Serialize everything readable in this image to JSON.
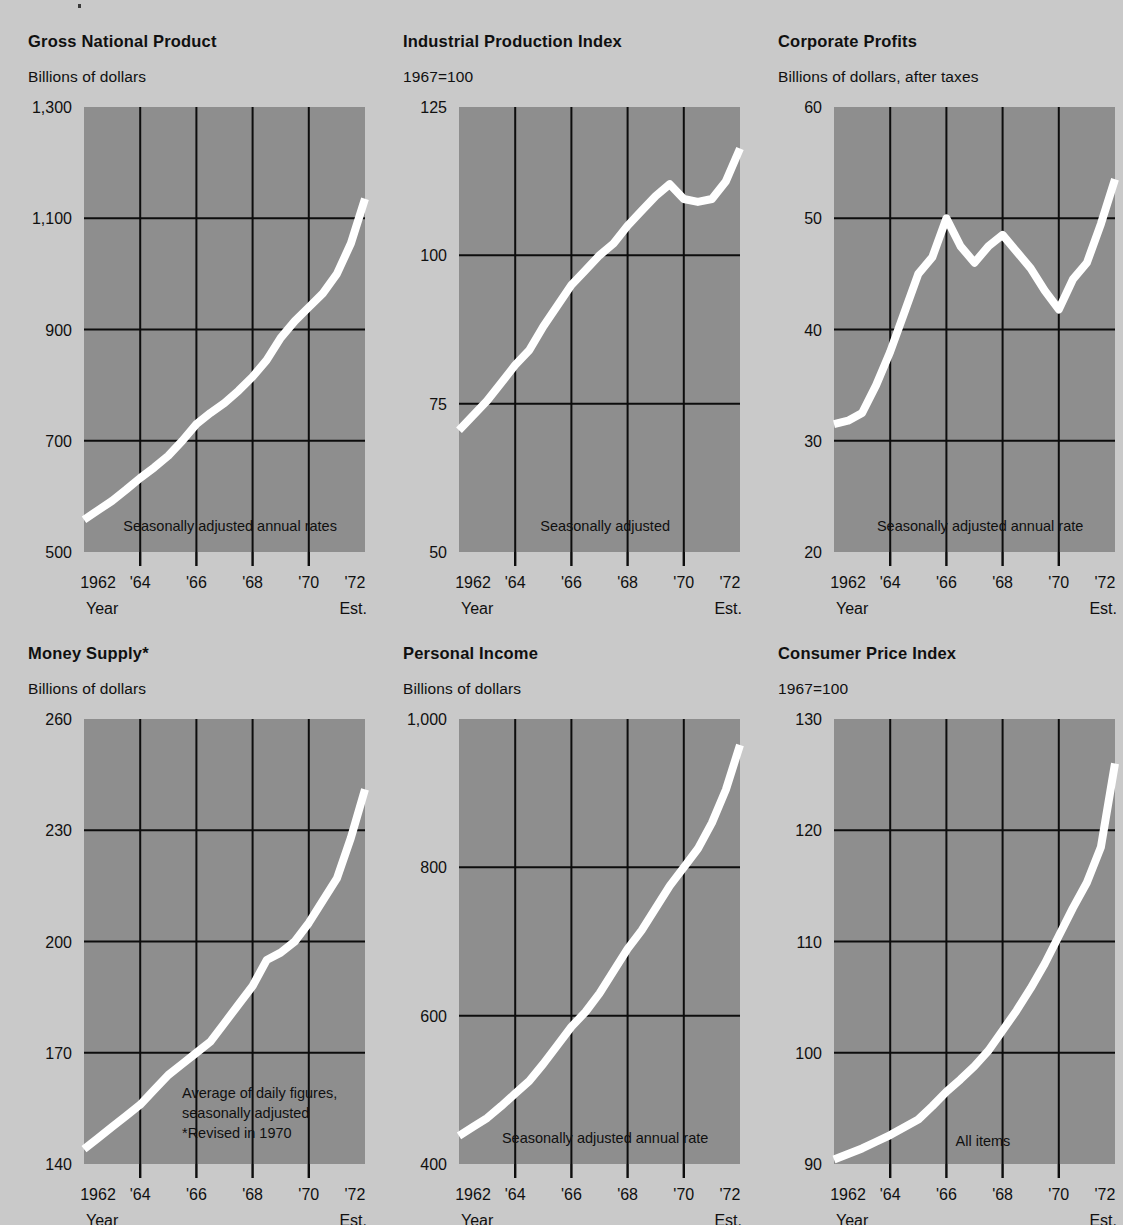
{
  "page": {
    "background_color": "#c9c9c9",
    "plot_background_color": "#8e8e8e",
    "line_color": "#ffffff",
    "grid_color": "#0d0d0d"
  },
  "common": {
    "x_axis_name": "Year",
    "x_axis_note": "Est.",
    "x_tick_labels": [
      "1962",
      "'64",
      "'66",
      "'68",
      "'70",
      "'72"
    ]
  },
  "charts": [
    {
      "id": "gross-national-product",
      "title": "Gross National Product",
      "subtitle": "Billions of dollars",
      "annotation": "Seasonally adjusted annual rates",
      "annotation_lines": [
        "Seasonally adjusted annual rates"
      ],
      "y_tick_labels": [
        "1,300",
        "1,100",
        "900",
        "700",
        "500"
      ],
      "chart_data": {
        "type": "line",
        "title": "Gross National Product",
        "subtitle": "Billions of dollars",
        "xlabel": "Year",
        "ylabel": "Billions of dollars",
        "ylim": [
          500,
          1300
        ],
        "yticks": [
          500,
          700,
          900,
          1100,
          1300
        ],
        "xlim": [
          1962,
          1972
        ],
        "xticks": [
          1962,
          1964,
          1966,
          1968,
          1970,
          1972
        ],
        "grid": true,
        "legend": "none",
        "annotations": [
          "Seasonally adjusted annual rates"
        ],
        "x": [
          1962.0,
          1962.5,
          1963.0,
          1963.5,
          1964.0,
          1964.5,
          1965.0,
          1965.5,
          1966.0,
          1966.5,
          1967.0,
          1967.5,
          1968.0,
          1968.5,
          1969.0,
          1969.5,
          1970.0,
          1970.5,
          1971.0,
          1971.5,
          1972.0
        ],
        "y": [
          558,
          575,
          592,
          612,
          633,
          652,
          673,
          700,
          730,
          750,
          768,
          790,
          815,
          845,
          885,
          915,
          940,
          965,
          1000,
          1055,
          1135
        ]
      }
    },
    {
      "id": "industrial-production-index",
      "title": "Industrial Production Index",
      "subtitle": "1967=100",
      "annotation": "Seasonally adjusted",
      "annotation_lines": [
        "Seasonally adjusted"
      ],
      "y_tick_labels": [
        "125",
        "100",
        "75",
        "50"
      ],
      "chart_data": {
        "type": "line",
        "title": "Industrial Production Index",
        "subtitle": "1967=100",
        "xlabel": "Year",
        "ylabel": "Index, 1967=100",
        "ylim": [
          50,
          125
        ],
        "yticks": [
          50,
          75,
          100,
          125
        ],
        "xlim": [
          1962,
          1972
        ],
        "xticks": [
          1962,
          1964,
          1966,
          1968,
          1970,
          1972
        ],
        "grid": true,
        "legend": "none",
        "annotations": [
          "Seasonally adjusted"
        ],
        "x": [
          1962.0,
          1962.5,
          1963.0,
          1963.5,
          1964.0,
          1964.5,
          1965.0,
          1965.5,
          1966.0,
          1966.5,
          1967.0,
          1967.5,
          1968.0,
          1968.5,
          1969.0,
          1969.5,
          1970.0,
          1970.5,
          1971.0,
          1971.5,
          1972.0
        ],
        "y": [
          70.5,
          73.0,
          75.5,
          78.5,
          81.5,
          84.0,
          88.0,
          91.5,
          95.0,
          97.5,
          100.0,
          102.0,
          105.0,
          107.5,
          110.0,
          112.0,
          109.5,
          109.0,
          109.5,
          112.5,
          118.0
        ]
      }
    },
    {
      "id": "corporate-profits",
      "title": "Corporate Profits",
      "subtitle": "Billions of dollars, after taxes",
      "annotation": "Seasonally adjusted annual rate",
      "annotation_lines": [
        "Seasonally adjusted annual rate"
      ],
      "y_tick_labels": [
        "60",
        "50",
        "40",
        "30",
        "20"
      ],
      "chart_data": {
        "type": "line",
        "title": "Corporate Profits",
        "subtitle": "Billions of dollars, after taxes",
        "xlabel": "Year",
        "ylabel": "Billions of dollars, after taxes",
        "ylim": [
          20,
          60
        ],
        "yticks": [
          20,
          30,
          40,
          50,
          60
        ],
        "xlim": [
          1962,
          1972
        ],
        "xticks": [
          1962,
          1964,
          1966,
          1968,
          1970,
          1972
        ],
        "grid": true,
        "legend": "none",
        "annotations": [
          "Seasonally adjusted annual rate"
        ],
        "x": [
          1962.0,
          1962.5,
          1963.0,
          1963.5,
          1964.0,
          1964.5,
          1965.0,
          1965.5,
          1966.0,
          1966.5,
          1967.0,
          1967.5,
          1968.0,
          1968.5,
          1969.0,
          1969.5,
          1970.0,
          1970.5,
          1971.0,
          1971.5,
          1972.0
        ],
        "y": [
          31.5,
          31.8,
          32.5,
          35.0,
          38.0,
          41.5,
          45.0,
          46.5,
          50.0,
          47.5,
          46.0,
          47.5,
          48.5,
          47.0,
          45.5,
          43.5,
          41.8,
          44.5,
          46.0,
          49.5,
          53.5
        ]
      }
    },
    {
      "id": "money-supply",
      "title": "Money Supply*",
      "subtitle": "Billions of dollars",
      "annotation": "Average of daily figures, seasonally adjusted *Revised in 1970",
      "annotation_lines": [
        "Average of daily figures,",
        "seasonally adjusted",
        "*Revised in 1970"
      ],
      "y_tick_labels": [
        "260",
        "230",
        "200",
        "170",
        "140"
      ],
      "chart_data": {
        "type": "line",
        "title": "Money Supply*",
        "subtitle": "Billions of dollars",
        "xlabel": "Year",
        "ylabel": "Billions of dollars",
        "ylim": [
          140,
          260
        ],
        "yticks": [
          140,
          170,
          200,
          230,
          260
        ],
        "xlim": [
          1962,
          1972
        ],
        "xticks": [
          1962,
          1964,
          1966,
          1968,
          1970,
          1972
        ],
        "grid": true,
        "legend": "none",
        "annotations": [
          "Average of daily figures,",
          "seasonally adjusted",
          "*Revised in 1970"
        ],
        "x": [
          1962.0,
          1962.5,
          1963.0,
          1963.5,
          1964.0,
          1964.5,
          1965.0,
          1965.5,
          1966.0,
          1966.5,
          1967.0,
          1967.5,
          1968.0,
          1968.5,
          1969.0,
          1969.5,
          1970.0,
          1970.5,
          1971.0,
          1971.5,
          1972.0
        ],
        "y": [
          144,
          147,
          150,
          153,
          156,
          160,
          164,
          167,
          170,
          173,
          178,
          183,
          188,
          195,
          197,
          200,
          205,
          211,
          217,
          228,
          241
        ]
      }
    },
    {
      "id": "personal-income",
      "title": "Personal Income",
      "subtitle": "Billions of dollars",
      "annotation": "Seasonally adjusted annual rate",
      "annotation_lines": [
        "Seasonally adjusted annual rate"
      ],
      "y_tick_labels": [
        "1,000",
        "800",
        "600",
        "400"
      ],
      "chart_data": {
        "type": "line",
        "title": "Personal Income",
        "subtitle": "Billions of dollars",
        "xlabel": "Year",
        "ylabel": "Billions of dollars",
        "ylim": [
          400,
          1000
        ],
        "yticks": [
          400,
          600,
          800,
          1000
        ],
        "xlim": [
          1962,
          1972
        ],
        "xticks": [
          1962,
          1964,
          1966,
          1968,
          1970,
          1972
        ],
        "grid": true,
        "legend": "none",
        "annotations": [
          "Seasonally adjusted annual rate"
        ],
        "x": [
          1962.0,
          1962.5,
          1963.0,
          1963.5,
          1964.0,
          1964.5,
          1965.0,
          1965.5,
          1966.0,
          1966.5,
          1967.0,
          1967.5,
          1968.0,
          1968.5,
          1969.0,
          1969.5,
          1970.0,
          1970.5,
          1971.0,
          1971.5,
          1972.0
        ],
        "y": [
          438,
          450,
          462,
          478,
          495,
          512,
          535,
          560,
          585,
          605,
          630,
          660,
          690,
          715,
          745,
          775,
          800,
          825,
          860,
          905,
          965
        ]
      }
    },
    {
      "id": "consumer-price-index",
      "title": "Consumer Price Index",
      "subtitle": "1967=100",
      "annotation": "All items",
      "annotation_lines": [
        "All items"
      ],
      "y_tick_labels": [
        "130",
        "120",
        "110",
        "100",
        "90"
      ],
      "chart_data": {
        "type": "line",
        "title": "Consumer Price Index",
        "subtitle": "1967=100",
        "xlabel": "Year",
        "ylabel": "Index, 1967=100",
        "ylim": [
          90,
          130
        ],
        "yticks": [
          90,
          100,
          110,
          120,
          130
        ],
        "xlim": [
          1962,
          1972
        ],
        "xticks": [
          1962,
          1964,
          1966,
          1968,
          1970,
          1972
        ],
        "grid": true,
        "legend": "none",
        "annotations": [
          "All items"
        ],
        "x": [
          1962.0,
          1962.5,
          1963.0,
          1963.5,
          1964.0,
          1964.5,
          1965.0,
          1965.5,
          1966.0,
          1966.5,
          1967.0,
          1967.5,
          1968.0,
          1968.5,
          1969.0,
          1969.5,
          1970.0,
          1970.5,
          1971.0,
          1971.5,
          1972.0
        ],
        "y": [
          90.4,
          90.9,
          91.4,
          92.0,
          92.6,
          93.3,
          94.0,
          95.2,
          96.5,
          97.6,
          98.8,
          100.2,
          102.0,
          103.8,
          105.8,
          108.0,
          110.5,
          113.0,
          115.3,
          118.5,
          126.0
        ]
      }
    }
  ]
}
